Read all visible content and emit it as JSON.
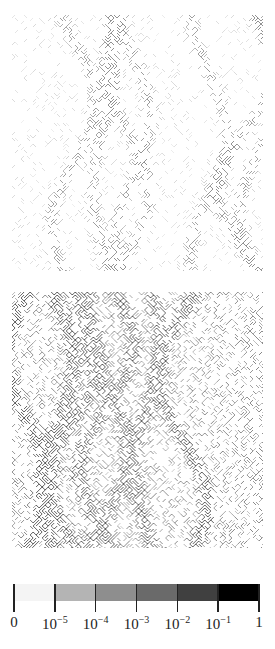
{
  "figure": {
    "panels": [
      {
        "id": "top",
        "description": "sparse lattice pattern, light with dark diagonal veins",
        "density": 0.35,
        "darkness": 0.55,
        "seed": 7
      },
      {
        "id": "bottom",
        "description": "dense lattice pattern, uniformly dark crosshatch",
        "density": 0.75,
        "darkness": 0.8,
        "seed": 19
      }
    ],
    "colorbar": {
      "segments": [
        {
          "range": "0 to 1e-5",
          "color": "#f4f4f4"
        },
        {
          "range": "1e-5 to 1e-4",
          "color": "#b4b4b4"
        },
        {
          "range": "1e-4 to 1e-3",
          "color": "#8e8e8e"
        },
        {
          "range": "1e-3 to 1e-2",
          "color": "#6a6a6a"
        },
        {
          "range": "1e-2 to 1e-1",
          "color": "#404040"
        },
        {
          "range": "1e-1 to 1",
          "color": "#000000"
        }
      ],
      "ticks": [
        {
          "base": "0",
          "exp": ""
        },
        {
          "base": "10",
          "exp": "−5"
        },
        {
          "base": "10",
          "exp": "−4"
        },
        {
          "base": "10",
          "exp": "−3"
        },
        {
          "base": "10",
          "exp": "−2"
        },
        {
          "base": "10",
          "exp": "−1"
        },
        {
          "base": "1",
          "exp": ""
        }
      ]
    }
  }
}
